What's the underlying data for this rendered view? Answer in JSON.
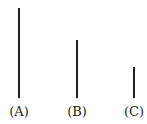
{
  "lines": [
    {
      "label": "(A)",
      "x": 18,
      "top": 8,
      "bottom": 98
    },
    {
      "label": "(B)",
      "x": 76,
      "top": 40,
      "bottom": 98
    },
    {
      "label": "(C)",
      "x": 133,
      "top": 67,
      "bottom": 98
    }
  ],
  "colors": {
    "line": "#222222",
    "background": "#ffffff"
  }
}
